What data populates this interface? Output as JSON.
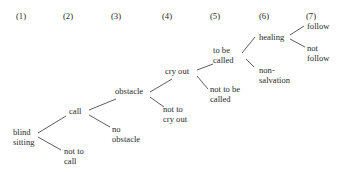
{
  "columns": [
    "(1)",
    "(2)",
    "(3)",
    "(4)",
    "(5)",
    "(6)",
    "(7)"
  ],
  "nodes": {
    "blind_sitting": "blind\nsitting",
    "not_to_call": "not to\ncall",
    "call": "call",
    "no_obstacle": "no\nobstacle",
    "obstacle": "obstacle",
    "not_to_cry_out": "not to\ncry out",
    "cry_out": "cry out",
    "not_to_be_called": "not to be\ncalled",
    "to_be_called": "to be\ncalled",
    "non_salvation": "non-\nsalvation",
    "healing": "healing",
    "follow": "follow",
    "not_follow": "not\nfollow"
  }
}
